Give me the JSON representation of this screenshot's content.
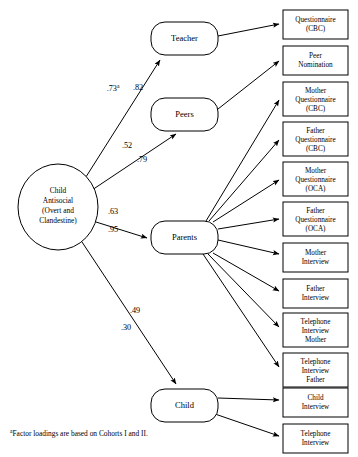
{
  "figure": {
    "background_color": "#ffffff",
    "line_color": "#000000",
    "width": 358,
    "height": 457
  },
  "latent": {
    "name": "child-antisocial",
    "shape": "ellipse",
    "lines": [
      "Child",
      "Antisocial",
      "(Overt and",
      "Clandestine)"
    ],
    "cx": 58,
    "cy": 207,
    "rx": 40,
    "ry": 43
  },
  "informants": [
    {
      "id": "teacher",
      "label": "Teacher",
      "x": 151,
      "y": 22,
      "w": 67,
      "h": 33
    },
    {
      "id": "peers",
      "label": "Peers",
      "x": 151,
      "y": 98,
      "w": 67,
      "h": 33
    },
    {
      "id": "parents",
      "label": "Parents",
      "x": 151,
      "y": 221,
      "w": 67,
      "h": 33
    },
    {
      "id": "child",
      "label": "Child",
      "x": 151,
      "y": 389,
      "w": 67,
      "h": 33
    }
  ],
  "indicators": [
    {
      "id": "questionnaire-cbc",
      "lines": [
        "Questionnaire",
        "(CBC)"
      ],
      "x": 283,
      "y": 10,
      "w": 65,
      "h": 29,
      "source": "teacher"
    },
    {
      "id": "peer-nomination",
      "lines": [
        "Peer",
        "Nomination"
      ],
      "x": 283,
      "y": 46,
      "w": 65,
      "h": 29,
      "source": "peers"
    },
    {
      "id": "mother-questionnaire-cbc",
      "lines": [
        "Mother",
        "Questionnaire",
        "(CBC)"
      ],
      "x": 283,
      "y": 82,
      "w": 65,
      "h": 34,
      "source": "parents"
    },
    {
      "id": "father-questionnaire-cbc",
      "lines": [
        "Father",
        "Questionnaire",
        "(CBC)"
      ],
      "x": 283,
      "y": 122,
      "w": 65,
      "h": 34,
      "source": "parents"
    },
    {
      "id": "mother-questionnaire-oca",
      "lines": [
        "Mother",
        "Questionnaire",
        "(OCA)"
      ],
      "x": 283,
      "y": 162,
      "w": 65,
      "h": 34,
      "source": "parents"
    },
    {
      "id": "father-questionnaire-oca",
      "lines": [
        "Father",
        "Questionnaire",
        "(OCA)"
      ],
      "x": 283,
      "y": 202,
      "w": 65,
      "h": 34,
      "source": "parents"
    },
    {
      "id": "mother-interview",
      "lines": [
        "Mother",
        "Interview"
      ],
      "x": 283,
      "y": 243,
      "w": 65,
      "h": 29,
      "source": "parents"
    },
    {
      "id": "father-interview",
      "lines": [
        "Father",
        "Interview"
      ],
      "x": 283,
      "y": 279,
      "w": 65,
      "h": 29,
      "source": "parents"
    },
    {
      "id": "telephone-interview-mother",
      "lines": [
        "Telephone",
        "Interview",
        "Mother"
      ],
      "x": 283,
      "y": 313,
      "w": 65,
      "h": 34,
      "source": "parents"
    },
    {
      "id": "telephone-interview-father",
      "lines": [
        "Telephone",
        "Interview",
        "Father"
      ],
      "x": 283,
      "y": 353,
      "w": 65,
      "h": 34,
      "source": "parents"
    },
    {
      "id": "child-interview",
      "lines": [
        "Child",
        "Interview"
      ],
      "x": 283,
      "y": 388,
      "w": 65,
      "h": 29,
      "source": "child"
    },
    {
      "id": "telephone-interview",
      "lines": [
        "Telephone",
        "Interview"
      ],
      "x": 283,
      "y": 424,
      "w": 65,
      "h": 29,
      "source": "child"
    }
  ],
  "coefficients": [
    {
      "id": "teacher-upper",
      "value": ".73",
      "superscript": "a",
      "x": 113,
      "y": 91,
      "target": "teacher"
    },
    {
      "id": "teacher-lower",
      "value": ".82",
      "superscript": "",
      "x": 138,
      "y": 90,
      "target": "teacher"
    },
    {
      "id": "peers-upper",
      "value": ".52",
      "superscript": "",
      "x": 127,
      "y": 148,
      "target": "peers"
    },
    {
      "id": "peers-lower",
      "value": ".79",
      "superscript": "",
      "x": 142,
      "y": 162,
      "target": "peers"
    },
    {
      "id": "parents-upper",
      "value": ".63",
      "superscript": "",
      "x": 113,
      "y": 214,
      "target": "parents"
    },
    {
      "id": "parents-lower",
      "value": ".95",
      "superscript": "",
      "x": 113,
      "y": 232,
      "target": "parents"
    },
    {
      "id": "child-upper",
      "value": ".49",
      "superscript": "",
      "x": 135,
      "y": 313,
      "target": "child"
    },
    {
      "id": "child-lower",
      "value": ".30",
      "superscript": "",
      "x": 126,
      "y": 330,
      "target": "child"
    }
  ],
  "footnote": {
    "superscript": "a",
    "text": "Factor loadings are based on Cohorts I and II."
  }
}
